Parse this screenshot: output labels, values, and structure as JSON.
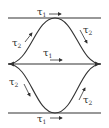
{
  "diagram": {
    "colors": {
      "line": "#333333",
      "background": "#ffffff"
    },
    "labels": {
      "top": {
        "symbol": "τ",
        "sub": "1"
      },
      "upper_left": {
        "symbol": "τ",
        "sub": "2"
      },
      "upper_right": {
        "symbol": "τ",
        "sub": "2"
      },
      "middle": {
        "symbol": "τ",
        "sub": "1"
      },
      "lower_left": {
        "symbol": "τ",
        "sub": "2"
      },
      "lower_right": {
        "symbol": "τ",
        "sub": "2"
      },
      "bottom": {
        "symbol": "τ",
        "sub": "1"
      }
    }
  }
}
